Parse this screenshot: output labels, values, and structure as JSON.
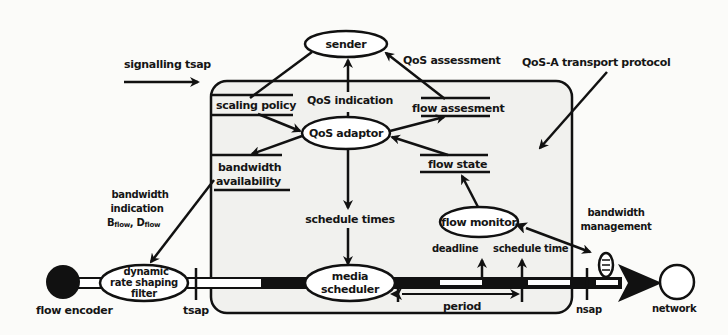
{
  "diagram": {
    "title": "QoS-A transport protocol",
    "colors": {
      "ink": "#111111",
      "paper": "#fbfbf9",
      "box_fill": "#f1f1ee"
    },
    "external_labels": {
      "signalling_tsap": "signalling tsap",
      "qos_assessment": "QoS assessment",
      "qos_a_transport_protocol": "QoS-A transport protocol",
      "bandwidth_indication": [
        "bandwidth",
        "indication"
      ],
      "bflow": "B",
      "dflow": "D",
      "flow_subscript": "flow",
      "bandwidth_management": [
        "bandwidth",
        "management"
      ],
      "tsap": "tsap",
      "nsap": "nsap",
      "flow_encoder": "flow encoder",
      "network": "network"
    },
    "nodes": {
      "sender": "sender",
      "qos_adaptor": "QoS adaptor",
      "flow_monitor": "flow monitor",
      "media_scheduler": [
        "media",
        "scheduler"
      ],
      "dynamic_rate_shaping_filter": [
        "dynamic",
        "rate shaping",
        "filter"
      ]
    },
    "data_stores": {
      "scaling_policy": "scaling policy",
      "flow_assessment": "flow assesment",
      "flow_state": "flow state",
      "bandwidth_availability": [
        "bandwidth",
        "availability"
      ]
    },
    "flow_labels": {
      "qos_indication": "QoS indication",
      "schedule_times": "schedule times",
      "deadline": "deadline",
      "schedule_time": "schedule time",
      "period": "period"
    }
  }
}
